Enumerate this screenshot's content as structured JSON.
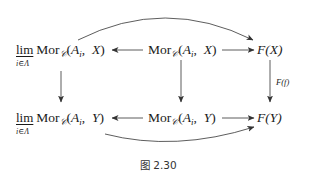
{
  "diagram": {
    "nodes": {
      "top_left": {
        "lim_word": "lim",
        "lim_subscript": "i∈Λ",
        "mor": "Mor",
        "mor_sub": "𝒞",
        "args_open": "(",
        "arg1": "A",
        "arg1_sub": "i",
        "comma": ",",
        "arg2": "X",
        "args_close": ")"
      },
      "top_middle": {
        "mor": "Mor",
        "mor_sub": "𝒞",
        "args_open": "(",
        "arg1": "A",
        "arg1_sub": "i",
        "comma": ",",
        "arg2": "X",
        "args_close": ")"
      },
      "top_right": {
        "text": "F(X)"
      },
      "bottom_left": {
        "lim_word": "lim",
        "lim_subscript": "i∈Λ",
        "mor": "Mor",
        "mor_sub": "𝒞",
        "args_open": "(",
        "arg1": "A",
        "arg1_sub": "i",
        "comma": ",",
        "arg2": "Y",
        "args_close": ")"
      },
      "bottom_middle": {
        "mor": "Mor",
        "mor_sub": "𝒞",
        "args_open": "(",
        "arg1": "A",
        "arg1_sub": "i",
        "comma": ",",
        "arg2": "Y",
        "args_close": ")"
      },
      "bottom_right": {
        "text": "F(Y)"
      }
    },
    "arrows": [
      {
        "from": "top_middle",
        "to": "top_left",
        "style": "straight"
      },
      {
        "from": "top_middle",
        "to": "top_right",
        "style": "straight"
      },
      {
        "from": "bottom_middle",
        "to": "bottom_left",
        "style": "straight"
      },
      {
        "from": "bottom_middle",
        "to": "bottom_right",
        "style": "straight"
      },
      {
        "from": "top_left",
        "to": "bottom_left",
        "style": "straight"
      },
      {
        "from": "top_middle",
        "to": "bottom_middle",
        "style": "straight"
      },
      {
        "from": "top_right",
        "to": "bottom_right",
        "style": "straight",
        "label": "F(f)"
      },
      {
        "from": "top_left",
        "to": "top_right",
        "style": "curved-above"
      },
      {
        "from": "bottom_left",
        "to": "bottom_right",
        "style": "curved-below"
      }
    ],
    "vertical_right_label": "F(f)",
    "stroke_color": "#333333"
  },
  "caption": "图 2.30"
}
